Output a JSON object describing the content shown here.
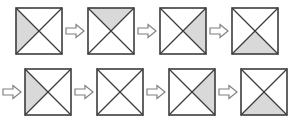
{
  "figure": {
    "background_color": "#ffffff",
    "shade_color": "#d9d9d9",
    "stroke_color": "#3c3c3c",
    "square_fill": "#ffffff",
    "arrow_fill": "#ffffff",
    "arrow_stroke": "#808080",
    "arrow_icon_name": "right-block-arrow-icon",
    "square_size_px": 48,
    "arrow_size_px": 20
  },
  "legend": {
    "positions": [
      "left",
      "top",
      "right",
      "bottom",
      "none"
    ],
    "sequence_rule": "clockwise"
  },
  "rows": [
    {
      "row_label": "row-1",
      "leading_arrow": false,
      "cells": [
        {
          "index": 1,
          "shaded": "left",
          "label": "square-1"
        },
        {
          "index": 2,
          "shaded": "top",
          "label": "square-2"
        },
        {
          "index": 3,
          "shaded": "right",
          "label": "square-3"
        },
        {
          "index": 4,
          "shaded": "bottom",
          "label": "square-4"
        }
      ]
    },
    {
      "row_label": "row-2",
      "leading_arrow": true,
      "cells": [
        {
          "index": 5,
          "shaded": "left",
          "label": "square-5"
        },
        {
          "index": 6,
          "shaded": "none",
          "label": "square-6"
        },
        {
          "index": 7,
          "shaded": "right",
          "label": "square-7"
        },
        {
          "index": 8,
          "shaded": "bottom",
          "label": "square-8"
        }
      ]
    }
  ]
}
